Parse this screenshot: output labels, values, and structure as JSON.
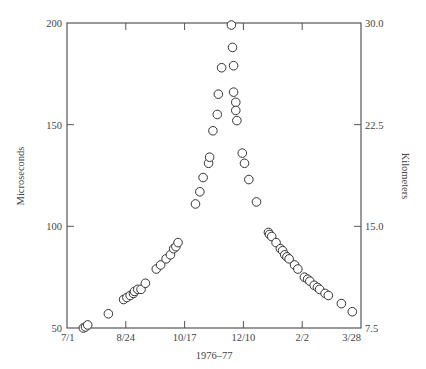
{
  "chart_data": {
    "type": "scatter",
    "title": "",
    "xlabel": "1976–77",
    "ylabel": "Microseconds",
    "ylabel_right": "Kilometers",
    "x_unit": "days since 7/1/1976",
    "xlim": [
      0,
      270
    ],
    "ylim": [
      50,
      200
    ],
    "x_ticks": [
      {
        "day": 0,
        "label": "7/1"
      },
      {
        "day": 54,
        "label": "8/24"
      },
      {
        "day": 108,
        "label": "10/17"
      },
      {
        "day": 162,
        "label": "12/10"
      },
      {
        "day": 216,
        "label": "2/2"
      },
      {
        "day": 270,
        "label": "3/28"
      }
    ],
    "y_ticks_left": [
      {
        "value": 50,
        "label": "50"
      },
      {
        "value": 100,
        "label": "100"
      },
      {
        "value": 150,
        "label": "150"
      },
      {
        "value": 200,
        "label": "200"
      }
    ],
    "y_ticks_right": [
      {
        "value": 50,
        "label": "7.5"
      },
      {
        "value": 100,
        "label": "15.0"
      },
      {
        "value": 150,
        "label": "22.5"
      },
      {
        "value": 200,
        "label": "30.0"
      }
    ],
    "grid": false,
    "legend": null,
    "marker": "open-circle",
    "series": [
      {
        "name": "measurements",
        "points": [
          [
            15,
            50
          ],
          [
            17,
            50.5
          ],
          [
            19,
            51.5
          ],
          [
            38,
            57
          ],
          [
            52,
            64
          ],
          [
            55,
            65
          ],
          [
            58,
            66
          ],
          [
            61,
            67
          ],
          [
            62,
            68
          ],
          [
            65,
            69
          ],
          [
            68,
            69
          ],
          [
            72,
            72
          ],
          [
            82,
            79
          ],
          [
            86,
            81
          ],
          [
            91,
            84
          ],
          [
            95,
            86
          ],
          [
            98,
            89
          ],
          [
            100,
            90
          ],
          [
            102,
            92
          ],
          [
            118,
            111
          ],
          [
            122,
            117
          ],
          [
            125,
            124
          ],
          [
            130,
            131
          ],
          [
            131,
            134
          ],
          [
            134,
            147
          ],
          [
            138,
            155
          ],
          [
            139,
            165
          ],
          [
            142,
            178
          ],
          [
            151,
            199
          ],
          [
            152,
            188
          ],
          [
            153,
            179
          ],
          [
            153,
            166
          ],
          [
            155,
            161
          ],
          [
            155,
            157
          ],
          [
            156,
            152
          ],
          [
            161,
            136
          ],
          [
            163,
            131
          ],
          [
            167,
            123
          ],
          [
            174,
            112
          ],
          [
            185,
            97
          ],
          [
            186,
            96
          ],
          [
            188,
            95
          ],
          [
            192,
            92
          ],
          [
            196,
            89
          ],
          [
            198,
            88
          ],
          [
            200,
            86
          ],
          [
            202,
            85
          ],
          [
            204,
            84
          ],
          [
            209,
            81
          ],
          [
            212,
            79
          ],
          [
            218,
            75
          ],
          [
            221,
            74
          ],
          [
            223,
            73
          ],
          [
            227,
            71
          ],
          [
            230,
            70
          ],
          [
            232,
            69
          ],
          [
            237,
            67
          ],
          [
            240,
            66
          ],
          [
            252,
            62
          ],
          [
            262,
            58
          ]
        ]
      }
    ]
  },
  "style": {
    "axis_color": "#555555",
    "marker_stroke": "#333333",
    "marker_fill": "#ffffff"
  }
}
